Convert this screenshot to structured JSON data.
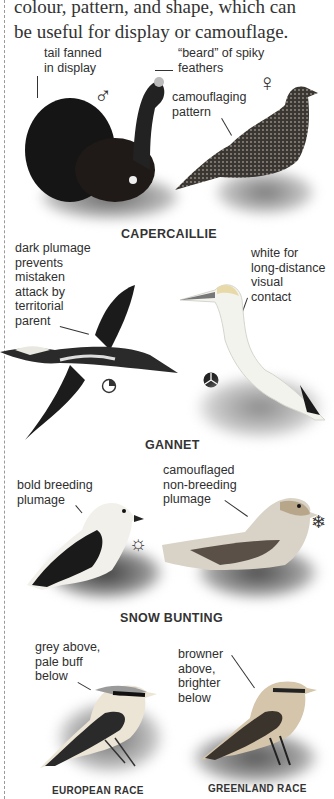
{
  "intro": {
    "text_line1": "colour, pattern, and shape, which can",
    "text_line2": "be useful for display or camouflage."
  },
  "capercaillie": {
    "caption": "CAPERCAILLIE",
    "labels": {
      "tail": "tail fanned\nin display",
      "beard": "“beard” of spiky\nfeathers",
      "camouflage": "camouflaging\npattern"
    },
    "male_symbol": "♂",
    "female_symbol": "♀"
  },
  "gannet": {
    "caption": "GANNET",
    "labels": {
      "dark": "dark plumage\nprevents\nmistaken\nattack by\nterritorial\nparent",
      "white": "white for\nlong-distance\nvisual\ncontact"
    },
    "juvenile_symbol": "juvenile-icon",
    "adult_symbol": "adult-icon"
  },
  "snow_bunting": {
    "caption": "SNOW BUNTING",
    "labels": {
      "breeding": "bold breeding\nplumage",
      "non_breeding": "camouflaged\nnon-breeding\nplumage"
    },
    "summer_symbol": "☼",
    "winter_symbol": "❄"
  },
  "wheatear": {
    "labels": {
      "european": "grey above,\npale buff\nbelow",
      "greenland": "browner\nabove,\nbrighter\nbelow"
    },
    "captions": {
      "european": "EUROPEAN RACE",
      "greenland": "GREENLAND RACE"
    }
  }
}
